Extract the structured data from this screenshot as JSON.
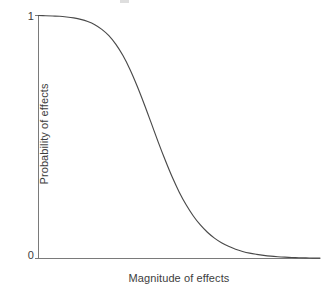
{
  "chart_data": {
    "type": "line",
    "title": "",
    "subtitle": "",
    "xlabel": "Magnitude of effects",
    "ylabel": "Probability of effects",
    "xticklabels": [],
    "yticklabels": [
      "1",
      "0"
    ],
    "ytick_top": "1",
    "ytick_bottom": "0",
    "xlim": [
      0,
      10
    ],
    "ylim": [
      0,
      1
    ],
    "grid": false,
    "legend": null,
    "legend_position": "none",
    "annotations": [],
    "curve_color": "#4a4a4a",
    "axis_color": "#7a7a7a",
    "text_color": "#3d3d3d",
    "background_color": "#ffffff",
    "series": [
      {
        "name": "Probability of effects",
        "x": [
          0.0,
          0.25,
          0.5,
          0.75,
          1.0,
          1.25,
          1.5,
          1.75,
          2.0,
          2.25,
          2.5,
          2.75,
          3.0,
          3.25,
          3.5,
          3.75,
          4.0,
          4.25,
          4.5,
          4.75,
          5.0,
          5.25,
          5.5,
          5.75,
          6.0,
          6.25,
          6.5,
          6.75,
          7.0,
          7.25,
          7.5,
          7.75,
          8.0,
          8.25,
          8.5,
          8.75,
          9.0,
          9.25,
          9.5,
          9.75,
          10.0
        ],
        "y": [
          1.0,
          0.999,
          0.998,
          0.997,
          0.994,
          0.99,
          0.984,
          0.975,
          0.962,
          0.943,
          0.917,
          0.881,
          0.835,
          0.778,
          0.711,
          0.637,
          0.559,
          0.48,
          0.405,
          0.335,
          0.273,
          0.22,
          0.175,
          0.138,
          0.108,
          0.084,
          0.065,
          0.05,
          0.038,
          0.029,
          0.022,
          0.017,
          0.013,
          0.0098,
          0.0074,
          0.0056,
          0.0043,
          0.0032,
          0.0024,
          0.0018,
          0.0014
        ]
      }
    ]
  },
  "figure": {
    "ytick_top_label": "1",
    "ytick_bottom_label": "0",
    "ylabel_text": "Probability of effects",
    "xlabel_text": "Magnitude of effects"
  }
}
